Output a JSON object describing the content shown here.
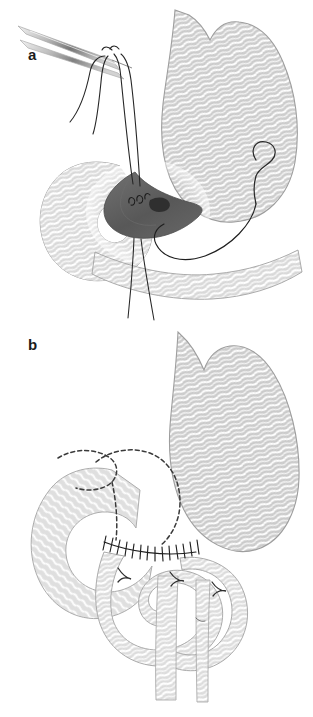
{
  "figure": {
    "orientation": "two-panel vertical",
    "background_color": "#ffffff",
    "panels": [
      {
        "id": "a",
        "label": "a",
        "caption": "Suturing of the posterior gastrojejunal anastomosis with needle holder and stay sutures",
        "elements": [
          {
            "name": "needle-holder",
            "label": "needle holder instrument"
          },
          {
            "name": "suture-threads",
            "label": "suture threads"
          },
          {
            "name": "stomach-body",
            "label": "stomach"
          },
          {
            "name": "duodenum-loop",
            "label": "duodenum"
          },
          {
            "name": "jejunal-loop",
            "label": "jejunal loop"
          },
          {
            "name": "open-lumen",
            "label": "opened lumen / enterotomy"
          },
          {
            "name": "curved-needle",
            "label": "curved suture needle"
          }
        ]
      },
      {
        "id": "b",
        "label": "b",
        "caption": "Completed anastomosis showing resection line and interrupted suture row",
        "elements": [
          {
            "name": "stomach-body",
            "label": "stomach"
          },
          {
            "name": "duodenum-loop",
            "label": "duodenum"
          },
          {
            "name": "resection-dashed-line",
            "label": "dashed resection line"
          },
          {
            "name": "anastomosis-suture-row",
            "label": "interrupted suture row"
          },
          {
            "name": "jejunal-limb-afferent",
            "label": "afferent jejunal limb"
          },
          {
            "name": "jejunal-limb-efferent",
            "label": "efferent jejunal limb"
          },
          {
            "name": "mesenteric-marks",
            "label": "serosal fold marks"
          }
        ]
      }
    ]
  },
  "colors": {
    "tissue_fill": "#c9c9c9",
    "tissue_fill_light": "#dedede",
    "tissue_stroke": "#9a9a9a",
    "texture_line": "#ffffff",
    "lumen_dark": "#5a5a5a",
    "lumen_mid": "#6e6e6e",
    "suture_black": "#222222",
    "instrument_gray": "#b5b5b5",
    "instrument_dark": "#8a8a8a",
    "label_color": "#1b1b1b",
    "background": "#ffffff"
  }
}
